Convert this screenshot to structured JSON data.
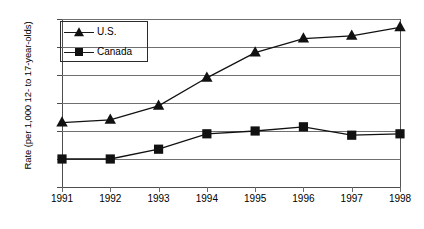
{
  "chart_data": {
    "type": "line",
    "title": "",
    "subtitle": "",
    "xlabel": "",
    "ylabel": "Rate (per 1,000 12- to 17-year-olds)",
    "categories": [
      "1991",
      "1992",
      "1993",
      "1994",
      "1995",
      "1996",
      "1997",
      "1998"
    ],
    "x": [
      1991,
      1992,
      1993,
      1994,
      1995,
      1996,
      1997,
      1998
    ],
    "series": [
      {
        "name": "U.S.",
        "marker": "triangle",
        "color": "#111111",
        "values": [
          2.3,
          2.4,
          2.9,
          3.9,
          4.8,
          5.3,
          5.4,
          5.7
        ]
      },
      {
        "name": "Canada",
        "marker": "square",
        "color": "#111111",
        "values": [
          1.0,
          1.0,
          1.35,
          1.9,
          2.0,
          2.15,
          1.85,
          1.9
        ]
      }
    ],
    "ylim": [
      0.0,
      6.0
    ],
    "yticks": [
      0.0,
      1.0,
      2.0,
      3.0,
      4.0,
      5.0,
      6.0
    ],
    "ytick_labels": [
      "0.00",
      "1.00",
      "2.00",
      "3.00",
      "4.00",
      "5.00",
      "6.00"
    ],
    "grid": true,
    "grid_axis": "y",
    "legend_position": "upper left",
    "legend_entries": [
      "U.S.",
      "Canada"
    ],
    "plot_background": "#ffffff",
    "axis_color": "#4d4d4d",
    "grid_color": "#6f6f6f"
  }
}
